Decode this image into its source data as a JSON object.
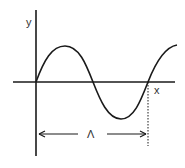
{
  "diagram": {
    "type": "sine-wave-wavelength",
    "axes": {
      "x_label": "x",
      "y_label": "y"
    },
    "wavelength_label": "Λ",
    "colors": {
      "stroke": "#1a1a1a",
      "text": "#333333",
      "background": "#ffffff"
    }
  }
}
